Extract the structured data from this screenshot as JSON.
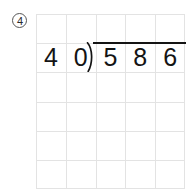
{
  "worksheet": {
    "problem_number": "4",
    "problem_number_style": "circled",
    "type": "long-division"
  },
  "division": {
    "divisor": "40",
    "divisor_digits": [
      "4",
      "0"
    ],
    "dividend": "586",
    "dividend_digits": [
      "5",
      "8",
      "6"
    ],
    "quotient_digits": [
      "",
      "",
      ""
    ],
    "bracket_glyph": ")",
    "overbar": true
  },
  "grid": {
    "columns": 5,
    "rows": 6,
    "line_color": "#e3e3e3",
    "cell_width": 29.8,
    "cell_height": 29.2
  },
  "colors": {
    "background": "#ffffff",
    "ink": "#141414",
    "label_ink": "#2b2b2b",
    "gridline": "#e3e3e3"
  }
}
